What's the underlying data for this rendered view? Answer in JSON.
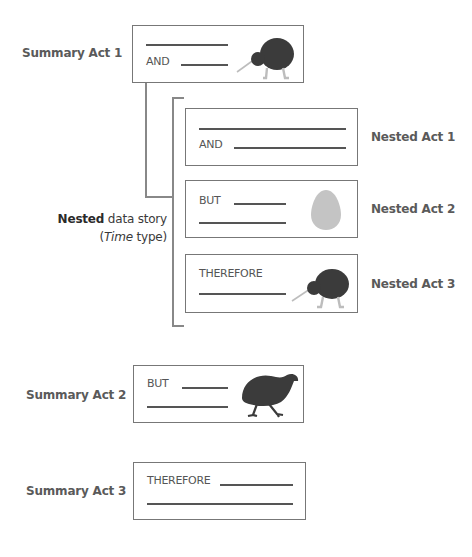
{
  "summary_acts": [
    {
      "label": "Summary Act 1",
      "word": "AND",
      "icon": "kiwi-icon"
    },
    {
      "label": "Summary Act 2",
      "word": "BUT",
      "icon": "weka-bird-icon"
    },
    {
      "label": "Summary Act 3",
      "word": "THEREFORE",
      "icon": ""
    }
  ],
  "nested_acts": [
    {
      "label": "Nested Act 1",
      "word": "AND",
      "icon": ""
    },
    {
      "label": "Nested Act 2",
      "word": "BUT",
      "icon": "egg-icon"
    },
    {
      "label": "Nested Act 3",
      "word": "THEREFORE",
      "icon": "kiwi-icon"
    }
  ],
  "nested_story": {
    "bold": "Nested",
    "rest": " data story",
    "paren_open": "(",
    "italic": "Time",
    "paren_rest": " type)"
  },
  "colors": {
    "border": "#777777",
    "rule": "#555555",
    "bird": "#3b3b3b",
    "legs": "#bdbdbd",
    "egg": "#c4c4c4"
  }
}
